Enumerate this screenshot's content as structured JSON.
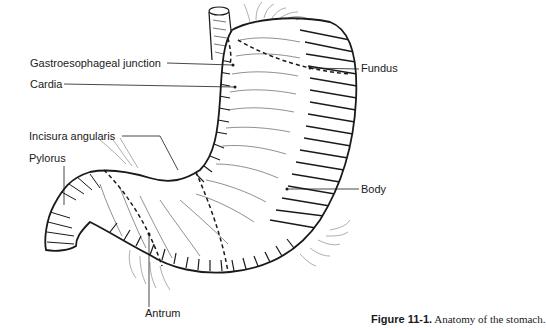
{
  "figure": {
    "number": "Figure 11-1.",
    "title": "Anatomy of the stomach."
  },
  "labels": {
    "gastroesophageal_junction": "Gastroesophageal junction",
    "cardia": "Cardia",
    "incisura_angularis": "Incisura angularis",
    "pylorus": "Pylorus",
    "fundus": "Fundus",
    "body": "Body",
    "antrum": "Antrum"
  },
  "colors": {
    "ink": "#1a1a1a",
    "background": "#ffffff"
  }
}
